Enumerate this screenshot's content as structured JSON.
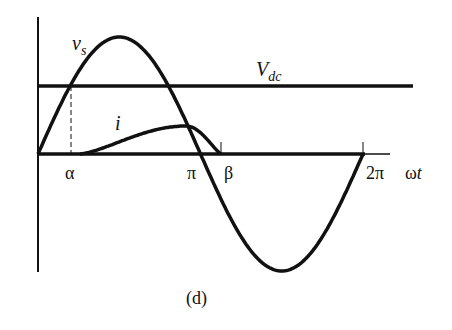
{
  "figure": {
    "caption": "(d)"
  },
  "labels": {
    "vs_main": "v",
    "vs_sub": "s",
    "vdc_main": "V",
    "vdc_sub": "dc",
    "i": "i",
    "alpha": "α",
    "pi": "π",
    "beta": "β",
    "two_pi": "2π",
    "omega_t_main": "ω",
    "omega_t_sub": "t"
  },
  "curves": [
    {
      "name": "v_s",
      "shape": "sinusoid",
      "period": "2π",
      "start": 0
    },
    {
      "name": "V_dc",
      "shape": "horizontal-line",
      "level_relative_to_peak": 0.43
    },
    {
      "name": "i",
      "shape": "pulse",
      "from": "α",
      "to": "β",
      "peak_near": "π*0.85"
    }
  ],
  "colors": {
    "line": "#111111",
    "background": "#ffffff"
  }
}
